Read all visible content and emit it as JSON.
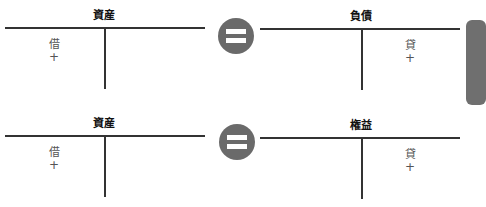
{
  "colors": {
    "line": "#333333",
    "equals_circle": "#6a6a6a",
    "edge_tab": "#6f6f6f"
  },
  "equations": [
    {
      "left_account": {
        "title": "資産",
        "side_label": "借",
        "sign": "+"
      },
      "operator_icon": "equals-icon",
      "right_account": {
        "title": "負債",
        "side_label": "貸",
        "sign": "+"
      }
    },
    {
      "left_account": {
        "title": "資産",
        "side_label": "借",
        "sign": "+"
      },
      "operator_icon": "equals-icon",
      "right_account": {
        "title": "権益",
        "side_label": "貸",
        "sign": "+"
      }
    }
  ]
}
